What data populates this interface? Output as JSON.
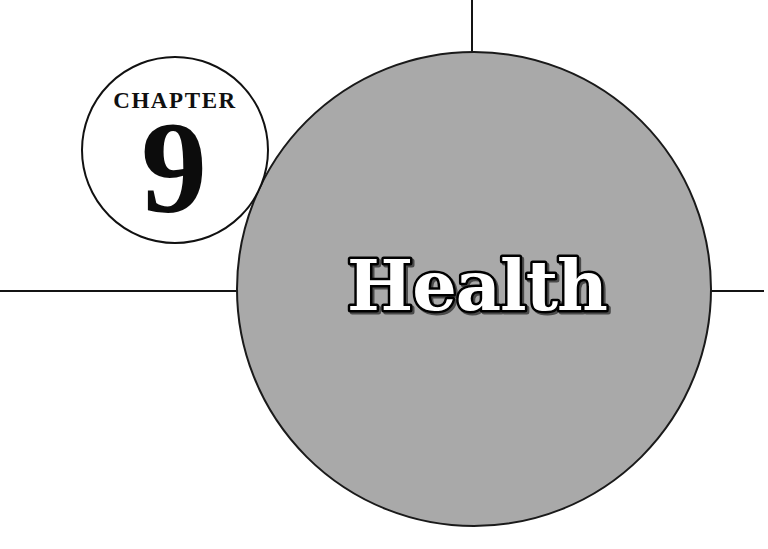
{
  "page": {
    "kind": "book-chapter-opener",
    "width": 768,
    "height": 549,
    "background_color": "#ffffff"
  },
  "chapter_badge": {
    "label": "CHAPTER",
    "number": "9",
    "circle": {
      "center_x": 175,
      "center_y": 150,
      "radius": 93,
      "fill_color": "#ffffff",
      "stroke_color": "#111111",
      "stroke_width": 2
    }
  },
  "title_disc": {
    "title": "Health",
    "circle": {
      "center_x": 474,
      "center_y": 289,
      "radius": 237,
      "fill_color": "#a9a9a9",
      "stroke_color": "#1a1a1a",
      "stroke_width": 2
    },
    "title_style": {
      "fill_color": "#ffffff",
      "outline_color": "#000000",
      "shadow_color": "#4a4a4a"
    }
  },
  "rules": {
    "horizontal": {
      "y": 291,
      "x_start": 0,
      "x_end": 764,
      "color": "#141414",
      "thickness": 2
    },
    "vertical": {
      "x": 472,
      "y_start": 0,
      "y_end": 60,
      "color": "#141414",
      "thickness": 2
    }
  }
}
